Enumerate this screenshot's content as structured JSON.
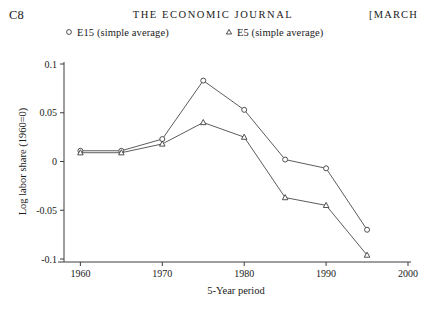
{
  "page_header": {
    "folio": "C8",
    "journal_title": "THE ECONOMIC JOURNAL",
    "issue_month": "[MARCH"
  },
  "legend": {
    "position": "above-plot",
    "entries": [
      {
        "marker": "circle-open-icon",
        "label": "E15 (simple average)"
      },
      {
        "marker": "triangle-open-icon",
        "label": "E5 (simple average)"
      }
    ]
  },
  "chart_data": {
    "type": "line",
    "title": "",
    "xlabel": "5-Year period",
    "ylabel": "Log labor share (1960=0)",
    "x": [
      1960,
      1965,
      1970,
      1975,
      1980,
      1985,
      1990,
      1995
    ],
    "xlim": [
      1958,
      2000
    ],
    "ylim": [
      -0.1,
      0.1
    ],
    "xticks": [
      1960,
      1970,
      1980,
      1990,
      2000
    ],
    "xticklabels": [
      "1960",
      "1970",
      "1980",
      "1990",
      "2000"
    ],
    "yticks": [
      0.1,
      0.05,
      0,
      -0.05,
      -0.1
    ],
    "yticklabels": [
      "0.1",
      "0.05",
      "0",
      "-0.05",
      "-0.1"
    ],
    "grid": false,
    "series": [
      {
        "name": "E15 (simple average)",
        "marker": "circle-open-icon",
        "values": [
          0.011,
          0.011,
          0.023,
          0.083,
          0.053,
          0.002,
          -0.007,
          -0.07
        ]
      },
      {
        "name": "E5 (simple average)",
        "marker": "triangle-open-icon",
        "values": [
          0.009,
          0.009,
          0.018,
          0.04,
          0.025,
          -0.037,
          -0.045,
          -0.096
        ]
      }
    ],
    "colors": {
      "line": "#4a4a4a",
      "axis": "#3d3d3d",
      "marker_fill": "#ffffff",
      "text": "#1a1a1a"
    }
  }
}
